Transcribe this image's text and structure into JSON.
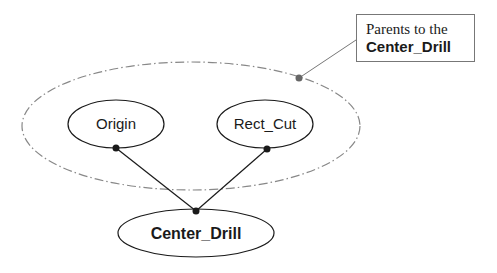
{
  "diagram": {
    "nodes": [
      {
        "id": "origin",
        "label": "Origin",
        "bold": false
      },
      {
        "id": "rect_cut",
        "label": "Rect_Cut",
        "bold": false
      },
      {
        "id": "center_drill",
        "label": "Center_Drill",
        "bold": true
      }
    ],
    "edges": [
      {
        "from": "origin",
        "to": "center_drill"
      },
      {
        "from": "rect_cut",
        "to": "center_drill"
      }
    ],
    "group": {
      "name": "parents-group",
      "style": "dash-dot",
      "members": [
        "origin",
        "rect_cut"
      ]
    },
    "callout": {
      "line1": "Parents to the",
      "line2": "Center_Drill"
    },
    "colors": {
      "stroke": "#1a1a1a",
      "group_stroke": "#888888",
      "callout_dot": "#666666"
    }
  }
}
